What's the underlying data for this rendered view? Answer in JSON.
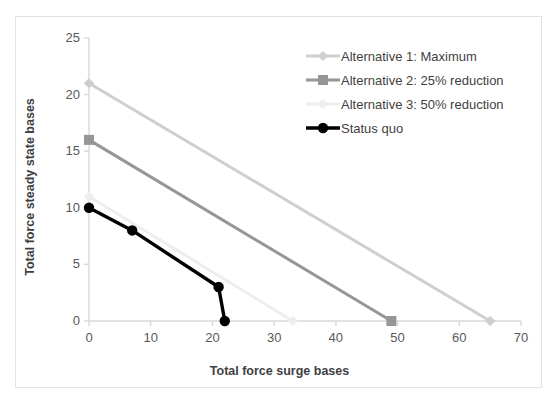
{
  "chart_data": {
    "type": "line",
    "title": "",
    "xlabel": "Total force surge bases",
    "ylabel": "Total force steady state bases",
    "xlim": [
      0,
      70
    ],
    "ylim": [
      0,
      25
    ],
    "xticks": [
      "0",
      "10",
      "20",
      "30",
      "40",
      "50",
      "60",
      "70"
    ],
    "yticks": [
      "0",
      "5",
      "10",
      "15",
      "20",
      "25"
    ],
    "grid": false,
    "legend_position": "top-right",
    "series": [
      {
        "name": "Alternative 1: Maximum",
        "color": "#cfcfcf",
        "marker": "diamond",
        "points": [
          [
            0,
            21
          ],
          [
            65,
            0
          ]
        ]
      },
      {
        "name": "Alternative 2: 25% reduction",
        "color": "#969696",
        "marker": "square",
        "points": [
          [
            0,
            16
          ],
          [
            49,
            0
          ]
        ]
      },
      {
        "name": "Alternative 3: 50% reduction",
        "color": "#eeeeee",
        "marker": "diamond",
        "points": [
          [
            0,
            11
          ],
          [
            33,
            0
          ]
        ]
      },
      {
        "name": "Status quo",
        "color": "#000000",
        "marker": "circle",
        "points": [
          [
            0,
            10
          ],
          [
            7,
            8
          ],
          [
            21,
            3
          ],
          [
            22,
            0
          ]
        ]
      }
    ]
  },
  "axes": {
    "x_title": "Total force surge bases",
    "y_title": "Total force steady state bases",
    "x_ticks": [
      "0",
      "10",
      "20",
      "30",
      "40",
      "50",
      "60",
      "70"
    ],
    "y_ticks": [
      "0",
      "5",
      "10",
      "15",
      "20",
      "25"
    ]
  },
  "legend": {
    "items": [
      {
        "label": "Alternative 1: Maximum",
        "color": "#cfcfcf",
        "marker": "diamond-icon"
      },
      {
        "label": "Alternative 2: 25% reduction",
        "color": "#969696",
        "marker": "square-icon"
      },
      {
        "label": "Alternative 3: 50% reduction",
        "color": "#eeeeee",
        "marker": "diamond-icon"
      },
      {
        "label": "Status quo",
        "color": "#000000",
        "marker": "circle-icon"
      }
    ]
  },
  "colors": {
    "axis_line": "#d9d9d9",
    "tick_text": "#5a5a5a",
    "title_text": "#3f3f3f",
    "frame_border": "#e3e3e3",
    "background": "#ffffff"
  }
}
